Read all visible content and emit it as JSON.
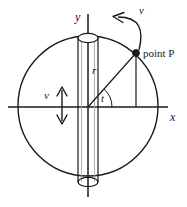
{
  "figure": {
    "background_color": "#ffffff",
    "stroke_color": "#1a1a1a",
    "faint_stroke_color": "#9a9a9a"
  },
  "axes": {
    "y_label": "y",
    "x_label": "x",
    "origin": {
      "x": 88,
      "y": 107
    },
    "y_axis": {
      "x": 88,
      "y_top": 14,
      "y_bottom": 197
    },
    "x_axis": {
      "y": 107,
      "x_left": 8,
      "x_right": 168
    }
  },
  "circle": {
    "center_x": 88,
    "center_y": 106,
    "radius": 70
  },
  "cylinder": {
    "left_x": 78,
    "right_x": 97,
    "inner_left_x": 81,
    "inner_right_x": 94,
    "top_y": 38,
    "bottom_y": 182,
    "ellipse_rx": 10,
    "ellipse_ry": 4.5
  },
  "point_p": {
    "label": "point P",
    "x": 136,
    "y": 53,
    "dot_radius": 3.2
  },
  "radius_line": {
    "label": "r",
    "from": {
      "x": 88,
      "y": 107
    },
    "to": {
      "x": 136,
      "y": 53
    }
  },
  "drop_line": {
    "from": {
      "x": 136,
      "y": 53
    },
    "to": {
      "x": 136,
      "y": 107
    }
  },
  "angle": {
    "label": "t",
    "vertex": {
      "x": 88,
      "y": 107
    },
    "arc_radius": 24
  },
  "velocity_tangential": {
    "label": "v",
    "arrow_tip": {
      "x": 114,
      "y": 17
    },
    "arrow_start": {
      "x": 139,
      "y": 50
    }
  },
  "velocity_vertical": {
    "label": "v",
    "arrow_x": 62,
    "arrow_top_y": 87,
    "arrow_bottom_y": 124
  }
}
